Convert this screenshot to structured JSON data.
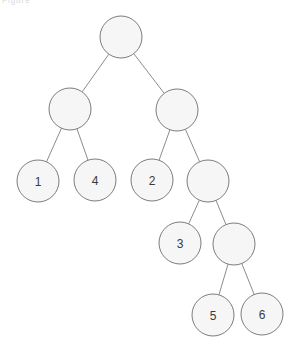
{
  "figure": {
    "type": "binary-tree-diagram",
    "width": 301,
    "height": 352,
    "background_color": "#ffffff",
    "top_artifact_text": "Figure",
    "node_fill_color": "#f6f6f6",
    "node_stroke_color": "#7d7d7d",
    "edge_color": "#8c8c8c",
    "label_color": "#3a3a3a",
    "node_radius": 21
  },
  "tree": {
    "nodes": [
      {
        "id": "root",
        "label": "",
        "cx": 121,
        "cy": 37,
        "depth": 0
      },
      {
        "id": "n-l",
        "label": "",
        "cx": 70,
        "cy": 109,
        "depth": 1
      },
      {
        "id": "n-r",
        "label": "",
        "cx": 177,
        "cy": 110,
        "depth": 1
      },
      {
        "id": "n-1",
        "label": "1",
        "cx": 38,
        "cy": 181,
        "depth": 2
      },
      {
        "id": "n-4",
        "label": "4",
        "cx": 95,
        "cy": 180,
        "depth": 2
      },
      {
        "id": "n-2",
        "label": "2",
        "cx": 152,
        "cy": 180,
        "depth": 2
      },
      {
        "id": "n-rr",
        "label": "",
        "cx": 208,
        "cy": 181,
        "depth": 2
      },
      {
        "id": "n-3",
        "label": "3",
        "cx": 180,
        "cy": 243,
        "depth": 3
      },
      {
        "id": "n-rrr",
        "label": "",
        "cx": 234,
        "cy": 244,
        "depth": 3
      },
      {
        "id": "n-5",
        "label": "5",
        "cx": 213,
        "cy": 315,
        "depth": 4
      },
      {
        "id": "n-6",
        "label": "6",
        "cx": 262,
        "cy": 314,
        "depth": 4
      }
    ],
    "edges": [
      {
        "from": "root",
        "to": "n-l"
      },
      {
        "from": "root",
        "to": "n-r"
      },
      {
        "from": "n-l",
        "to": "n-1"
      },
      {
        "from": "n-l",
        "to": "n-4"
      },
      {
        "from": "n-r",
        "to": "n-2"
      },
      {
        "from": "n-r",
        "to": "n-rr"
      },
      {
        "from": "n-rr",
        "to": "n-3"
      },
      {
        "from": "n-rr",
        "to": "n-rrr"
      },
      {
        "from": "n-rrr",
        "to": "n-5"
      },
      {
        "from": "n-rrr",
        "to": "n-6"
      }
    ]
  }
}
